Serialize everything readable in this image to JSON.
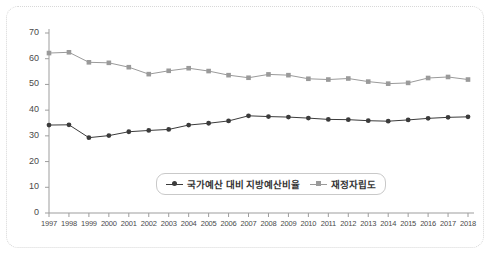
{
  "chart_data": {
    "type": "line",
    "title": "",
    "subtitle": "",
    "xlabel": "",
    "ylabel": "",
    "grid": false,
    "legend_position": "inside-bottom-center",
    "xlim": [
      1997,
      2018
    ],
    "ylim": [
      0,
      70
    ],
    "ytick_labels": [
      "0",
      "10",
      "20",
      "30",
      "40",
      "50",
      "60",
      "70"
    ],
    "yticks": [
      0,
      10,
      20,
      30,
      40,
      50,
      60,
      70
    ],
    "categories": [
      "1997",
      "1998",
      "1999",
      "2000",
      "2001",
      "2002",
      "2003",
      "2004",
      "2005",
      "2006",
      "2007",
      "2008",
      "2009",
      "2010",
      "2011",
      "2012",
      "2013",
      "2014",
      "2015",
      "2016",
      "2017",
      "2018"
    ],
    "series": [
      {
        "name": "국가예산 대비 지방예산비율",
        "color": "#3b3b3b",
        "marker": "circle",
        "values": [
          34.2,
          34.3,
          29.3,
          30.1,
          31.6,
          32.1,
          32.5,
          34.2,
          34.9,
          35.8,
          37.8,
          37.5,
          37.3,
          36.9,
          36.4,
          36.3,
          35.9,
          35.7,
          36.2,
          36.8,
          37.2,
          37.4
        ]
      },
      {
        "name": "재정자립도",
        "color": "#9a9a9a",
        "marker": "square",
        "values": [
          62.2,
          62.5,
          58.6,
          58.4,
          56.7,
          54.0,
          55.3,
          56.3,
          55.2,
          53.6,
          52.6,
          53.9,
          53.6,
          52.2,
          51.9,
          52.3,
          51.1,
          50.3,
          50.6,
          52.5,
          52.9,
          51.9
        ]
      }
    ]
  },
  "legend": {
    "items": [
      {
        "label": "국가예산 대비 지방예산비율",
        "color": "#3b3b3b",
        "marker": "circle"
      },
      {
        "label": "재정자립도",
        "color": "#9a9a9a",
        "marker": "square"
      }
    ]
  }
}
